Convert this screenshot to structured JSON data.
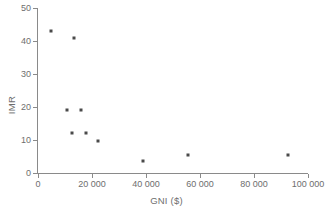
{
  "chart_data": {
    "type": "scatter",
    "title": "",
    "xlabel": "GNI ($)",
    "ylabel": "IMR",
    "xlim": [
      0,
      100000
    ],
    "ylim": [
      0,
      50
    ],
    "grid": false,
    "legend": "none",
    "marker_color": "#4a4a4a",
    "axis_color": "#8a8a8a",
    "text_color": "#6e6e6e",
    "x_ticks": [
      0,
      20000,
      40000,
      60000,
      80000,
      100000
    ],
    "x_tick_labels": [
      "0",
      "20 000",
      "40 000",
      "60 000",
      "80 000",
      "100 000"
    ],
    "y_ticks": [
      0,
      10,
      20,
      30,
      40,
      50
    ],
    "y_tick_labels": [
      "0",
      "10",
      "20",
      "30",
      "40",
      "50"
    ],
    "points": [
      {
        "x": 4800,
        "y": 43.0
      },
      {
        "x": 13300,
        "y": 41.0
      },
      {
        "x": 10700,
        "y": 19.0
      },
      {
        "x": 16000,
        "y": 19.0
      },
      {
        "x": 12600,
        "y": 12.0
      },
      {
        "x": 17800,
        "y": 12.0
      },
      {
        "x": 22200,
        "y": 9.6
      },
      {
        "x": 39000,
        "y": 3.7
      },
      {
        "x": 55500,
        "y": 5.5
      },
      {
        "x": 92500,
        "y": 5.5
      }
    ]
  }
}
